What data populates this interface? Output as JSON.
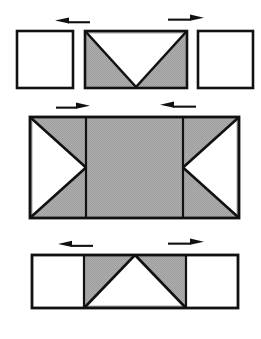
{
  "figure": {
    "canvas": {
      "width": 261,
      "height": 339
    },
    "colors": {
      "background": "#ffffff",
      "shade_fill": "#a9a9a9",
      "white_fill": "#ffffff",
      "stroke": "#111111",
      "arrow": "#111111"
    },
    "stroke_width": 2.4,
    "cell_size": 56,
    "rows": [
      {
        "id": "row-top",
        "name": "top-row",
        "y": 31,
        "height": 57,
        "gapped": true,
        "cells": [
          {
            "id": "top-cell-left",
            "name": "plain-square-left",
            "x": 17,
            "width": 56,
            "fill": "white",
            "wedge": "none"
          },
          {
            "id": "top-cell-middle",
            "name": "shaded-rect-down-notch",
            "x": 85,
            "width": 102,
            "fill": "shade",
            "wedge": "white-triangle-down",
            "wedge_note": "white triangle, base along top edge, apex at bottom centre"
          },
          {
            "id": "top-cell-right",
            "name": "plain-square-right",
            "x": 198,
            "width": 55,
            "fill": "white",
            "wedge": "none"
          }
        ],
        "arrows": [
          {
            "id": "arrow-top-left",
            "name": "arrow-left",
            "direction": "left",
            "x": 55,
            "y": 20,
            "length": 34
          },
          {
            "id": "arrow-top-right",
            "name": "arrow-right",
            "direction": "right",
            "x": 168,
            "y": 17,
            "length": 36
          }
        ]
      },
      {
        "id": "row-middle",
        "name": "middle-row",
        "y": 117,
        "height": 101,
        "gapped": false,
        "x": 30,
        "width": 209,
        "dividers": [
          86,
          183
        ],
        "cells": [
          {
            "id": "mid-cell-left",
            "name": "shaded-square-right-pointing-notch",
            "x": 30,
            "width": 56,
            "fill": "shade",
            "wedge": "white-triangle-right",
            "wedge_note": "white triangle, base along left edge, apex at right centre"
          },
          {
            "id": "mid-cell-centre",
            "name": "shaded-square-plain",
            "x": 86,
            "width": 97,
            "fill": "shade",
            "wedge": "none"
          },
          {
            "id": "mid-cell-right",
            "name": "shaded-square-left-pointing-notch",
            "x": 183,
            "width": 56,
            "fill": "shade",
            "wedge": "white-triangle-left",
            "wedge_note": "white triangle, base along right edge, apex at left centre"
          }
        ],
        "arrows": [
          {
            "id": "arrow-mid-left",
            "name": "arrow-right",
            "direction": "right",
            "x": 56,
            "y": 105,
            "length": 34
          },
          {
            "id": "arrow-mid-right",
            "name": "arrow-left",
            "direction": "left",
            "x": 160,
            "y": 104,
            "length": 36
          }
        ]
      },
      {
        "id": "row-bottom",
        "name": "bottom-row",
        "y": 255,
        "height": 53,
        "gapped": false,
        "x": 32,
        "width": 206,
        "dividers": [
          84,
          186
        ],
        "cells": [
          {
            "id": "bot-cell-left",
            "name": "plain-square-left",
            "x": 32,
            "width": 52,
            "fill": "white",
            "wedge": "none"
          },
          {
            "id": "bot-cell-centre",
            "name": "shaded-square-up-pointing-notch",
            "x": 84,
            "width": 102,
            "fill": "shade",
            "wedge": "white-triangle-up",
            "wedge_note": "white triangle, base along bottom edge, apex at top centre"
          },
          {
            "id": "bot-cell-right",
            "name": "plain-square-right",
            "x": 186,
            "width": 52,
            "fill": "white",
            "wedge": "none"
          }
        ],
        "arrows": [
          {
            "id": "arrow-bot-left",
            "name": "arrow-left",
            "direction": "left",
            "x": 58,
            "y": 243,
            "length": 34
          },
          {
            "id": "arrow-bot-right",
            "name": "arrow-right",
            "direction": "right",
            "x": 168,
            "y": 241,
            "length": 36
          }
        ]
      }
    ]
  }
}
